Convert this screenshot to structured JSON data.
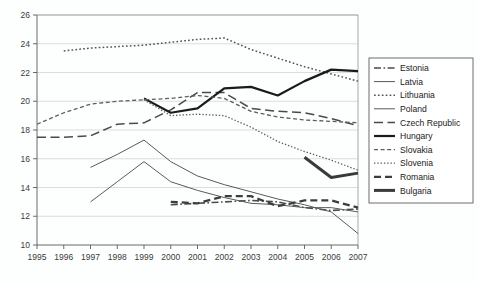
{
  "chart_data": {
    "type": "line",
    "title": "",
    "xlabel": "",
    "ylabel": "",
    "x": [
      1995,
      1996,
      1997,
      1998,
      1999,
      2000,
      2001,
      2002,
      2003,
      2004,
      2005,
      2006,
      2007
    ],
    "xlim": [
      1995,
      2007
    ],
    "ylim": [
      10,
      26
    ],
    "yticks": [
      10,
      12,
      14,
      16,
      18,
      20,
      22,
      24,
      26
    ],
    "xticks": [
      "1995",
      "1996",
      "1997",
      "1998",
      "1999",
      "2000",
      "2001",
      "2002",
      "2003",
      "2004",
      "2005",
      "2006",
      "2007"
    ],
    "grid": true,
    "legend_position": "right-outside",
    "series": [
      {
        "name": "Estonia",
        "style": "dash-dot",
        "color": "#4b4b4b",
        "width": 1.6,
        "x": [
          2000,
          2001,
          2002,
          2003,
          2004,
          2005,
          2006,
          2007
        ],
        "values": [
          12.8,
          12.9,
          13.0,
          13.1,
          13.0,
          12.6,
          12.4,
          12.5
        ]
      },
      {
        "name": "Latvia",
        "style": "solid-thin",
        "color": "#5a5a5a",
        "width": 1.0,
        "x": [
          1997,
          1998,
          1999,
          2000,
          2001,
          2002,
          2003,
          2004,
          2005,
          2006,
          2007
        ],
        "values": [
          15.4,
          16.3,
          17.3,
          15.8,
          14.8,
          14.2,
          13.7,
          13.2,
          12.8,
          12.3,
          10.8
        ]
      },
      {
        "name": "Lithuania",
        "style": "dotted",
        "color": "#555555",
        "width": 1.5,
        "x": [
          1996,
          1997,
          1998,
          1999,
          2000,
          2001,
          2002,
          2003,
          2004,
          2005,
          2006,
          2007
        ],
        "values": [
          23.5,
          23.7,
          23.8,
          23.9,
          24.1,
          24.3,
          24.4,
          23.6,
          23.0,
          22.4,
          21.9,
          21.4
        ]
      },
      {
        "name": "Poland",
        "style": "solid-thin",
        "color": "#5a5a5a",
        "width": 1.0,
        "x": [
          1997,
          1998,
          1999,
          2000,
          2001,
          2002,
          2003,
          2004,
          2005,
          2006,
          2007
        ],
        "values": [
          13.0,
          14.4,
          15.8,
          14.4,
          13.8,
          13.3,
          12.9,
          12.8,
          12.6,
          12.6,
          12.3
        ]
      },
      {
        "name": "Czech Republic",
        "style": "long-dash",
        "color": "#4a4a4a",
        "width": 1.5,
        "x": [
          1995,
          1996,
          1997,
          1998,
          1999,
          2000,
          2001,
          2002,
          2003,
          2004,
          2005,
          2006,
          2007
        ],
        "values": [
          17.5,
          17.5,
          17.6,
          18.4,
          18.5,
          19.4,
          20.6,
          20.6,
          19.5,
          19.3,
          19.2,
          18.8,
          18.3
        ]
      },
      {
        "name": "Hungary",
        "style": "solid-thick",
        "color": "#1b1b1b",
        "width": 2.2,
        "x": [
          1999,
          2000,
          2001,
          2002,
          2003,
          2004,
          2005,
          2006,
          2007
        ],
        "values": [
          20.2,
          19.2,
          19.5,
          20.9,
          21.0,
          20.4,
          21.4,
          22.2,
          22.1
        ]
      },
      {
        "name": "Slovakia",
        "style": "short-dash",
        "color": "#5e5e5e",
        "width": 1.3,
        "x": [
          1995,
          1996,
          1997,
          1998,
          1999,
          2000,
          2001,
          2002,
          2003,
          2004,
          2005,
          2006,
          2007
        ],
        "values": [
          18.4,
          19.2,
          19.8,
          20.0,
          20.1,
          20.2,
          20.4,
          20.2,
          19.3,
          18.9,
          18.7,
          18.6,
          18.5
        ]
      },
      {
        "name": "Slovenia",
        "style": "fine-dotted",
        "color": "#5e5e5e",
        "width": 1.3,
        "x": [
          1999,
          2000,
          2001,
          2002,
          2003,
          2004,
          2005,
          2006,
          2007
        ],
        "values": [
          20.1,
          19.0,
          19.1,
          19.0,
          18.2,
          17.2,
          16.5,
          15.9,
          15.2
        ]
      },
      {
        "name": "Romania",
        "style": "thick-dash",
        "color": "#3d3d3d",
        "width": 2.3,
        "x": [
          2000,
          2001,
          2002,
          2003,
          2004,
          2005,
          2006,
          2007
        ],
        "values": [
          13.0,
          12.9,
          13.4,
          13.4,
          12.7,
          13.1,
          13.1,
          12.6
        ]
      },
      {
        "name": "Bulgaria",
        "style": "solid-very-thick",
        "color": "#3a3a3a",
        "width": 3.0,
        "x": [
          2005,
          2006,
          2007
        ],
        "values": [
          16.1,
          14.7,
          15.0
        ]
      }
    ],
    "legend_entries": [
      {
        "label": "Estonia",
        "style": "dash-dot"
      },
      {
        "label": "Latvia",
        "style": "solid-thin"
      },
      {
        "label": "Lithuania",
        "style": "dotted"
      },
      {
        "label": "Poland",
        "style": "solid-thin"
      },
      {
        "label": "Czech Republic",
        "style": "long-dash"
      },
      {
        "label": "Hungary",
        "style": "solid-thick"
      },
      {
        "label": "Slovakia",
        "style": "short-dash"
      },
      {
        "label": "Slovenia",
        "style": "fine-dotted"
      },
      {
        "label": "Romania",
        "style": "thick-dash"
      },
      {
        "label": "Bulgaria",
        "style": "solid-very-thick"
      }
    ]
  }
}
